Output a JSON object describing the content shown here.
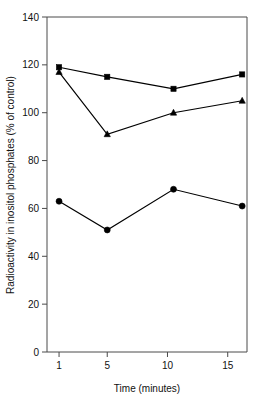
{
  "chart_data": {
    "type": "line",
    "title": "",
    "xlabel": "Time (minutes)",
    "ylabel": "Radioactivity in inositol phosphates (% of control)",
    "xlim": [
      0,
      16.6
    ],
    "ylim": [
      0,
      140
    ],
    "xticks": [
      1,
      5,
      10,
      15
    ],
    "xtick_labels": [
      "1",
      "5",
      "10",
      "15"
    ],
    "yticks": [
      0,
      20,
      40,
      60,
      80,
      100,
      120,
      140
    ],
    "ytick_labels": [
      "0",
      "20",
      "40",
      "60",
      "80",
      "100",
      "120",
      "140"
    ],
    "grid": false,
    "legend": "none",
    "series": [
      {
        "name": "series-squares",
        "marker": "square",
        "color": "#000000",
        "x": [
          1,
          5,
          10.5,
          16.2
        ],
        "values": [
          119,
          115,
          110,
          116
        ]
      },
      {
        "name": "series-triangles",
        "marker": "triangle",
        "color": "#000000",
        "x": [
          1,
          5,
          10.5,
          16.2
        ],
        "values": [
          117,
          91,
          100,
          105
        ]
      },
      {
        "name": "series-circles",
        "marker": "circle",
        "color": "#000000",
        "x": [
          1,
          5,
          10.5,
          16.2
        ],
        "values": [
          63,
          51,
          68,
          61
        ]
      }
    ]
  },
  "axes": {
    "x_title": "Time (minutes)",
    "y_title": "Radioactivity in inositol phosphates (% of control)"
  }
}
